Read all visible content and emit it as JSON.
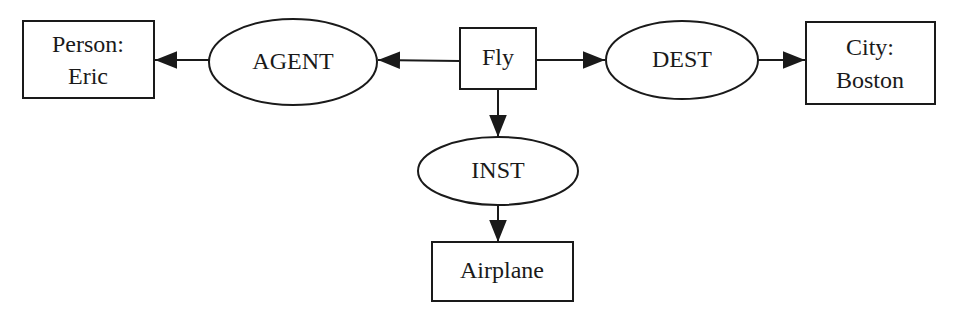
{
  "diagram": {
    "type": "conceptual-graph",
    "nodes": [
      {
        "id": "person",
        "shape": "rect",
        "lines": [
          "Person:",
          "Eric"
        ]
      },
      {
        "id": "agent",
        "shape": "ellipse",
        "lines": [
          "AGENT"
        ]
      },
      {
        "id": "fly",
        "shape": "rect",
        "lines": [
          "Fly"
        ]
      },
      {
        "id": "dest",
        "shape": "ellipse",
        "lines": [
          "DEST"
        ]
      },
      {
        "id": "city",
        "shape": "rect",
        "lines": [
          "City:",
          "Boston"
        ]
      },
      {
        "id": "inst",
        "shape": "ellipse",
        "lines": [
          "INST"
        ]
      },
      {
        "id": "airplane",
        "shape": "rect",
        "lines": [
          "Airplane"
        ]
      }
    ],
    "edges": [
      {
        "from": "fly",
        "to": "agent"
      },
      {
        "from": "agent",
        "to": "person"
      },
      {
        "from": "fly",
        "to": "dest"
      },
      {
        "from": "dest",
        "to": "city"
      },
      {
        "from": "fly",
        "to": "inst"
      },
      {
        "from": "inst",
        "to": "airplane"
      }
    ],
    "colors": {
      "stroke": "#1a1a1a",
      "background": "#ffffff"
    }
  }
}
